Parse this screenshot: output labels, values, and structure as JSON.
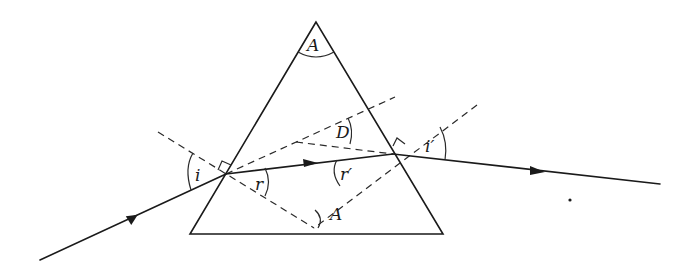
{
  "diagram": {
    "labels": {
      "apex_angle": "A",
      "normal_angle": "A",
      "deviation": "D",
      "incidence": "i",
      "refraction_first": "r",
      "refraction_second": "r′",
      "emergence": "i′"
    },
    "colors": {
      "ink": "#1a1a1a",
      "background": "#ffffff"
    }
  }
}
